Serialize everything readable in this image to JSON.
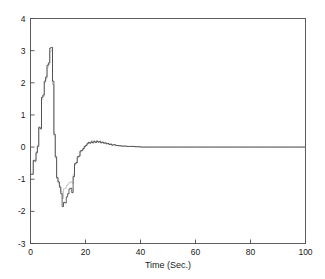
{
  "chart_data": {
    "type": "line",
    "title": "",
    "subtitle": "",
    "xlabel": "Time (Sec.)",
    "ylabel": "",
    "xlim": [
      0,
      100
    ],
    "ylim": [
      -3,
      4
    ],
    "xticks": [
      0,
      20,
      40,
      60,
      80,
      100
    ],
    "xtick_labels": [
      "0",
      "20",
      "40",
      "60",
      "80",
      "100"
    ],
    "yticks": [
      -3,
      -2,
      -1,
      0,
      1,
      2,
      3,
      4
    ],
    "ytick_labels": [
      "-3",
      "-2",
      "-1",
      "0",
      "1",
      "2",
      "3",
      "4"
    ],
    "grid": false,
    "legend": "none",
    "line_style": "stairstep",
    "colors": {
      "series_1": "#2b2b2b",
      "series_2": "#b9b9b9",
      "axis": "#4d4d4d"
    },
    "series": [
      {
        "name": "response",
        "color": "#2b2b2b",
        "x": [
          0,
          0.5,
          1,
          1.5,
          2,
          2.5,
          3,
          3.5,
          4,
          4.5,
          5,
          5.5,
          6,
          6.5,
          7,
          7.5,
          8,
          8.5,
          9,
          9.5,
          10,
          10.5,
          11,
          11.5,
          12,
          12.5,
          13,
          13.5,
          14,
          14.5,
          15,
          15.5,
          16,
          16.5,
          17,
          17.5,
          18,
          18.5,
          19,
          19.5,
          20,
          20.5,
          21,
          21.5,
          22,
          22.5,
          23,
          23.5,
          24,
          24.5,
          25,
          25.5,
          26,
          26.5,
          27,
          27.5,
          28,
          28.5,
          29,
          29.5,
          30,
          31,
          32,
          33,
          34,
          35,
          36,
          38,
          40,
          45,
          50,
          55,
          60,
          65,
          70,
          75,
          80,
          85,
          90,
          95,
          100
        ],
        "values": [
          -0.85,
          -0.85,
          -0.42,
          -0.44,
          -0.18,
          0.02,
          0.62,
          0.58,
          1.55,
          1.62,
          2.05,
          2.18,
          2.55,
          2.62,
          3.08,
          3.1,
          2.05,
          0.4,
          -0.3,
          -0.95,
          -1.08,
          -1.25,
          -1.45,
          -1.85,
          -1.72,
          -1.74,
          -1.55,
          -1.45,
          -1.3,
          -1.28,
          -1.42,
          -0.92,
          -0.52,
          -0.48,
          -0.3,
          -0.28,
          -0.12,
          -0.1,
          -0.05,
          0.02,
          0.05,
          0.1,
          0.14,
          0.12,
          0.16,
          0.13,
          0.17,
          0.14,
          0.18,
          0.15,
          0.17,
          0.13,
          0.15,
          0.12,
          0.13,
          0.1,
          0.11,
          0.08,
          0.09,
          0.06,
          0.07,
          0.05,
          0.04,
          0.03,
          0.03,
          0.02,
          0.02,
          0.01,
          0.0,
          0.0,
          0.0,
          0.0,
          0.0,
          0.0,
          0.0,
          0.0,
          0.0,
          0.0,
          0.0,
          0.0,
          0.0
        ]
      },
      {
        "name": "reference",
        "color": "#b9b9b9",
        "x": [
          0,
          0.5,
          1,
          1.5,
          2,
          2.5,
          3,
          3.5,
          4,
          4.5,
          5,
          5.5,
          6,
          6.5,
          7,
          7.5,
          8,
          8.5,
          9,
          9.5,
          10,
          10.5,
          11,
          11.5,
          12,
          12.5,
          13,
          13.5,
          14,
          14.5,
          15,
          15.5,
          16,
          16.5,
          17,
          17.5,
          18,
          18.5,
          19,
          19.5,
          20,
          20.5,
          21,
          21.5,
          22,
          22.5,
          23,
          23.5,
          24,
          24.5,
          25,
          25.5,
          26,
          26.5,
          27,
          27.5,
          28,
          28.5,
          29,
          29.5,
          30,
          31,
          32,
          33,
          34,
          35,
          36,
          38,
          40,
          45,
          50,
          55,
          60,
          65,
          70,
          75,
          80,
          85,
          90,
          95,
          100
        ],
        "values": [
          -0.8,
          -0.82,
          -0.4,
          -0.4,
          -0.14,
          0.06,
          0.58,
          0.55,
          1.48,
          1.58,
          2.0,
          2.12,
          2.48,
          2.56,
          2.98,
          3.02,
          1.95,
          0.35,
          -0.35,
          -0.98,
          -1.12,
          -1.2,
          -1.38,
          -1.6,
          -1.3,
          -1.28,
          -1.2,
          -1.15,
          -1.1,
          -1.08,
          -1.12,
          -0.85,
          -0.55,
          -0.5,
          -0.34,
          -0.3,
          -0.15,
          -0.12,
          -0.06,
          0.01,
          0.04,
          0.12,
          0.16,
          0.14,
          0.2,
          0.16,
          0.2,
          0.17,
          0.21,
          0.17,
          0.19,
          0.15,
          0.16,
          0.13,
          0.14,
          0.11,
          0.12,
          0.09,
          0.1,
          0.07,
          0.07,
          0.05,
          0.04,
          0.03,
          0.03,
          0.02,
          0.02,
          0.01,
          0.0,
          0.0,
          0.0,
          0.0,
          0.0,
          0.0,
          0.0,
          0.0,
          0.0,
          0.0,
          0.0,
          0.0,
          0.0
        ]
      }
    ]
  }
}
